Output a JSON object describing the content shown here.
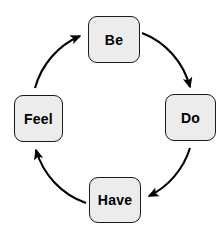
{
  "diagram": {
    "type": "cycle-diagram",
    "direction": "clockwise",
    "background_color": "#ffffff",
    "node_fill_color": "#ececec",
    "node_border_color": "#1a1a1a",
    "arrow_color": "#000000",
    "text_color": "#000000",
    "nodes": [
      {
        "id": "be",
        "label": "Be",
        "position": "top"
      },
      {
        "id": "do",
        "label": "Do",
        "position": "right"
      },
      {
        "id": "have",
        "label": "Have",
        "position": "bottom"
      },
      {
        "id": "feel",
        "label": "Feel",
        "position": "left"
      }
    ],
    "edges": [
      {
        "from": "be",
        "to": "do",
        "arrowhead": "solid-triangle"
      },
      {
        "from": "do",
        "to": "have",
        "arrowhead": "solid-triangle"
      },
      {
        "from": "have",
        "to": "feel",
        "arrowhead": "solid-triangle"
      },
      {
        "from": "feel",
        "to": "be",
        "arrowhead": "solid-triangle"
      }
    ]
  }
}
